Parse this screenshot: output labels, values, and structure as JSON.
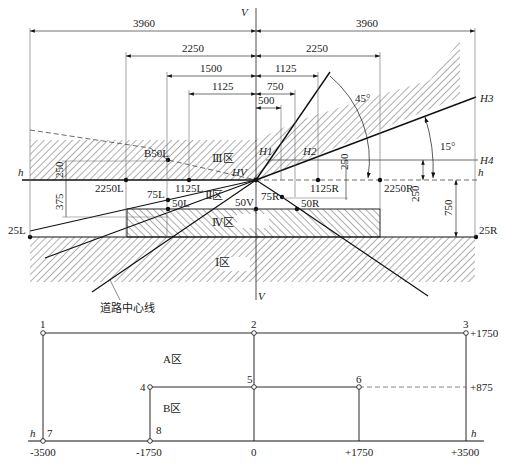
{
  "diagram": {
    "top": {
      "axes": {
        "vertical_label": "V",
        "horizontal_label": "h"
      },
      "dimensions_left": [
        "3960",
        "2250",
        "1500",
        "1125"
      ],
      "dimensions_right": [
        "3960",
        "2250",
        "1125",
        "750",
        "500"
      ],
      "angles": [
        "45°",
        "15°"
      ],
      "lines": [
        "H1",
        "H2",
        "H3",
        "H4",
        "HV"
      ],
      "zones": [
        "Ⅰ区",
        "Ⅱ区",
        "Ⅲ区",
        "Ⅳ区"
      ],
      "points": {
        "b50l": "B50L",
        "p2250l": "2250L",
        "p1125l": "1125L",
        "p75l": "75L",
        "p50l": "50L",
        "p25l": "25L",
        "p50v": "50V",
        "p75r": "75R",
        "p50r": "50R",
        "p1125r": "1125R",
        "p2250r": "2250R",
        "p25r": "25R"
      },
      "vertical_dims": {
        "left_250": "250",
        "left_375": "375",
        "mid_250": "250",
        "right_250": "250",
        "right_750": "750"
      },
      "road_centerline_label": "道路中心线"
    },
    "bottom": {
      "zones": [
        "A区",
        "B区"
      ],
      "point_numbers": [
        "1",
        "2",
        "3",
        "4",
        "5",
        "6",
        "7",
        "8"
      ],
      "x_ticks": [
        "-3500",
        "-1750",
        "0",
        "+1750",
        "+3500"
      ],
      "y_ticks": [
        "+1750",
        "+875"
      ],
      "h_label": "h"
    },
    "caption": ""
  }
}
